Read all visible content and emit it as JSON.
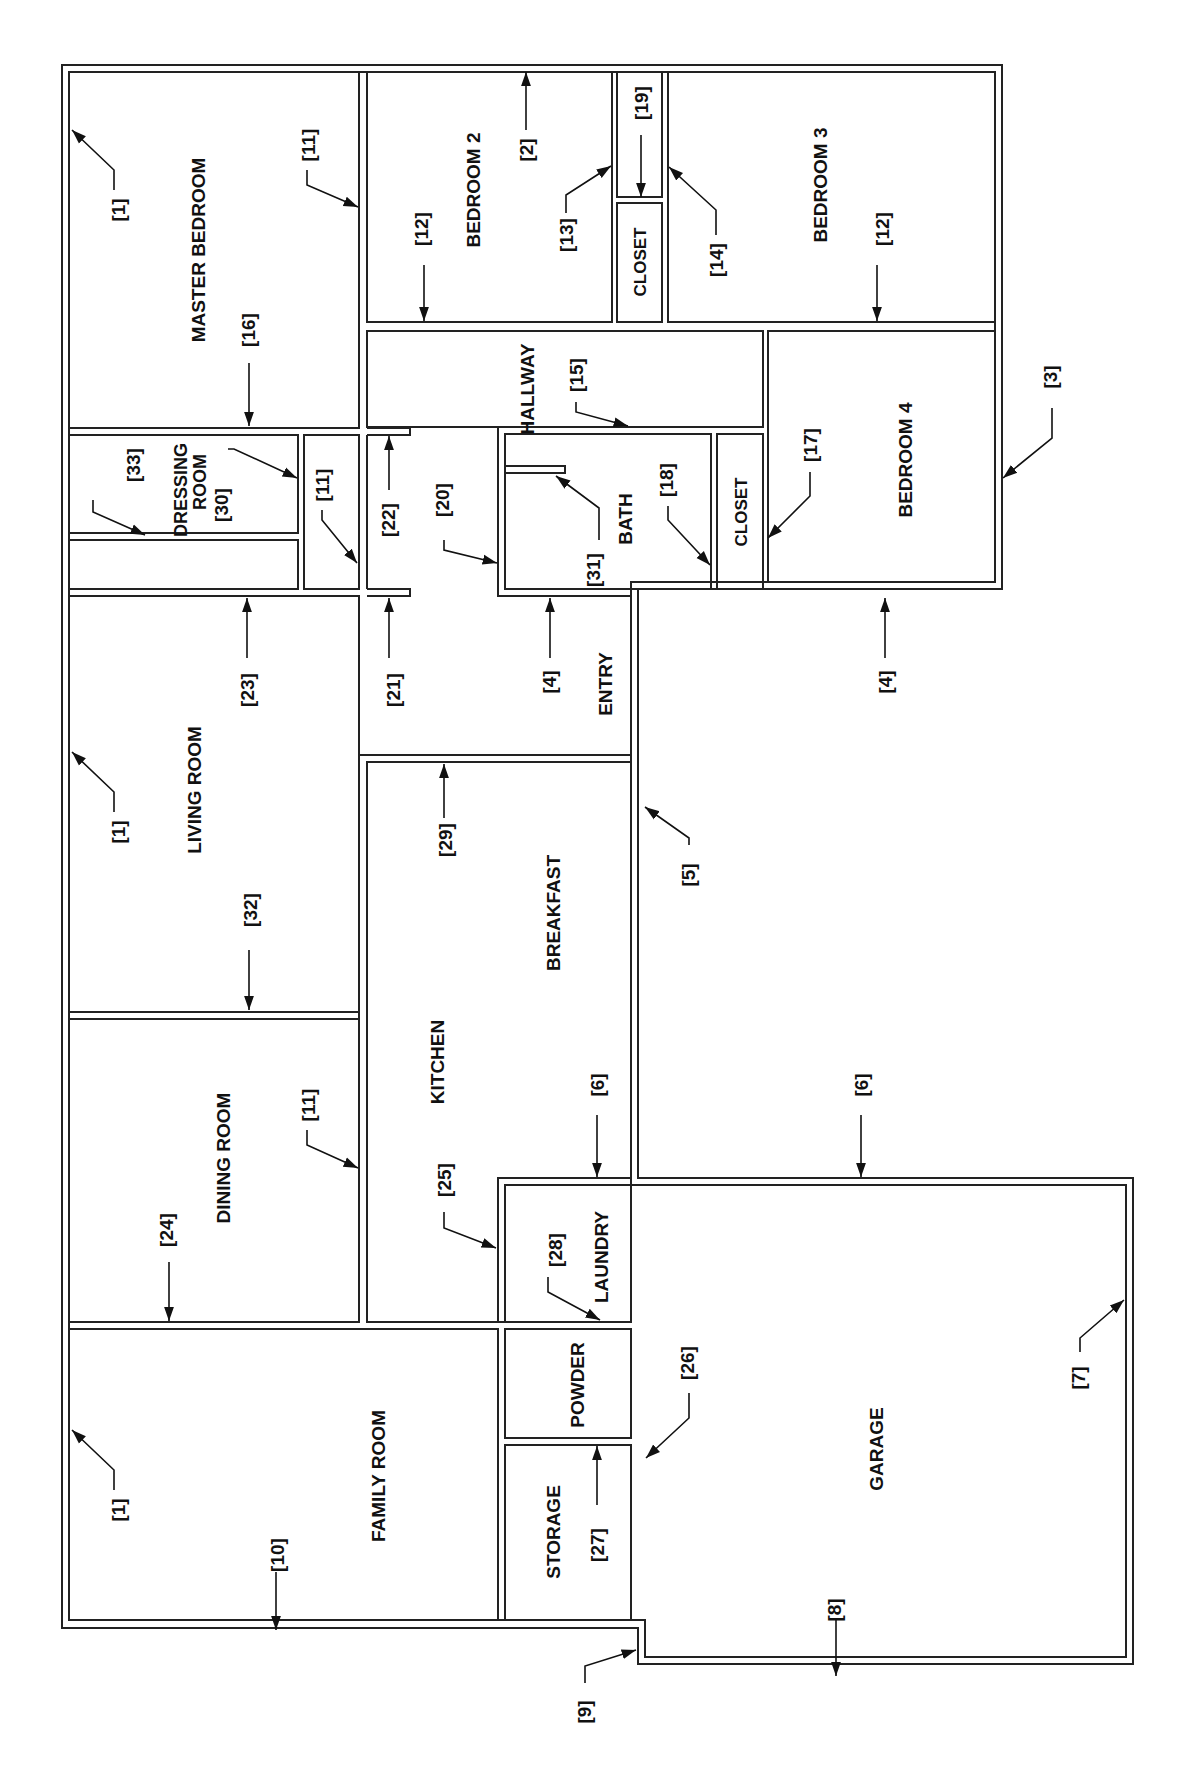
{
  "diagram": {
    "type": "floor-plan",
    "orientation": "rotated 90° (text reads bottom-to-top)",
    "line_color": "#222222",
    "background": "#ffffff"
  },
  "rooms": [
    {
      "id": "master-bedroom",
      "label": "MASTER BEDROOM"
    },
    {
      "id": "bedroom-2",
      "label": "BEDROOM 2"
    },
    {
      "id": "closet-1",
      "label": "CLOSET"
    },
    {
      "id": "bedroom-3",
      "label": "BEDROOM 3"
    },
    {
      "id": "dressing-room",
      "label": "DRESSING ROOM"
    },
    {
      "id": "hallway",
      "label": "HALLWAY"
    },
    {
      "id": "bath",
      "label": "BATH"
    },
    {
      "id": "closet-2",
      "label": "CLOSET"
    },
    {
      "id": "bedroom-4",
      "label": "BEDROOM 4"
    },
    {
      "id": "entry",
      "label": "ENTRY"
    },
    {
      "id": "living-room",
      "label": "LIVING ROOM"
    },
    {
      "id": "breakfast",
      "label": "BREAKFAST"
    },
    {
      "id": "kitchen",
      "label": "KITCHEN"
    },
    {
      "id": "dining-room",
      "label": "DINING ROOM"
    },
    {
      "id": "laundry",
      "label": "LAUNDRY"
    },
    {
      "id": "powder",
      "label": "POWDER"
    },
    {
      "id": "storage",
      "label": "STORAGE"
    },
    {
      "id": "family-room",
      "label": "FAMILY ROOM"
    },
    {
      "id": "garage",
      "label": "GARAGE"
    }
  ],
  "callouts": [
    {
      "label": "[1]",
      "target": "master bedroom outer wall"
    },
    {
      "label": "[11]",
      "target": "master bedroom / bedroom 2 wall"
    },
    {
      "label": "[16]",
      "target": "master bedroom / dressing room wall"
    },
    {
      "label": "[12]",
      "target": "bedroom 2 / hallway wall"
    },
    {
      "label": "[2]",
      "target": "top outer wall"
    },
    {
      "label": "[13]",
      "target": "bedroom 2 / closet wall"
    },
    {
      "label": "[19]",
      "target": "closet divider"
    },
    {
      "label": "[14]",
      "target": "closet / bedroom 3 wall"
    },
    {
      "label": "[12]",
      "target": "bedroom 3 / bedroom 4 wall"
    },
    {
      "label": "[33]",
      "target": "dressing room lower wall"
    },
    {
      "label": "[30]",
      "target": "dressing room side wall"
    },
    {
      "label": "[11]",
      "target": "small closet wall"
    },
    {
      "label": "[22]",
      "target": "hallway partition upper"
    },
    {
      "label": "[20]",
      "target": "hallway / bath wall"
    },
    {
      "label": "[15]",
      "target": "hallway / bath top wall"
    },
    {
      "label": "[31]",
      "target": "bath stub wall"
    },
    {
      "label": "[18]",
      "target": "bath / closet wall"
    },
    {
      "label": "[17]",
      "target": "closet / bedroom 4 wall"
    },
    {
      "label": "[3]",
      "target": "bedroom 4 outer wall"
    },
    {
      "label": "[23]",
      "target": "living room top wall"
    },
    {
      "label": "[21]",
      "target": "hallway partition lower"
    },
    {
      "label": "[4]",
      "target": "entry / bath wall"
    },
    {
      "label": "[4]",
      "target": "bedroom 4 bottom exterior wall"
    },
    {
      "label": "[1]",
      "target": "living room outer wall"
    },
    {
      "label": "[29]",
      "target": "breakfast top wall"
    },
    {
      "label": "[5]",
      "target": "entry / breakfast exterior wall"
    },
    {
      "label": "[32]",
      "target": "living / dining wall"
    },
    {
      "label": "[11]",
      "target": "dining / kitchen wall"
    },
    {
      "label": "[6]",
      "target": "laundry top wall"
    },
    {
      "label": "[6]",
      "target": "garage top wall"
    },
    {
      "label": "[24]",
      "target": "dining / family room wall"
    },
    {
      "label": "[25]",
      "target": "kitchen / laundry wall"
    },
    {
      "label": "[28]",
      "target": "laundry / powder wall"
    },
    {
      "label": "[26]",
      "target": "storage / garage wall"
    },
    {
      "label": "[7]",
      "target": "garage outer wall"
    },
    {
      "label": "[1]",
      "target": "family room outer wall"
    },
    {
      "label": "[10]",
      "target": "family room bottom wall"
    },
    {
      "label": "[27]",
      "target": "storage / powder wall"
    },
    {
      "label": "[8]",
      "target": "garage bottom wall"
    },
    {
      "label": "[9]",
      "target": "exterior corner"
    }
  ]
}
